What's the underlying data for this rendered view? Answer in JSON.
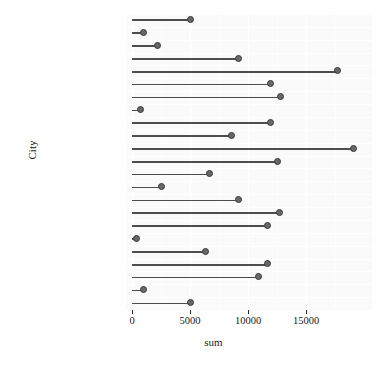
{
  "chart_data": {
    "type": "bar",
    "subtype": "lollipop-horizontal",
    "title": "",
    "xlabel": "sum",
    "ylabel": "City",
    "xlim": [
      0,
      19500
    ],
    "ylim": null,
    "grid": true,
    "legend": "none",
    "orientation": "horizontal",
    "x_ticks": [
      0,
      5000,
      10000,
      15000
    ],
    "x_tick_labels": [
      "0",
      "5000",
      "10000",
      "15000"
    ],
    "categories": [
      "Yakima",
      "Walla Walla",
      "Victoria",
      "Vancouver",
      "Tacoma",
      "Spokane",
      "Seattle",
      "San Francisco",
      "San Diego",
      "San Andres",
      "Salem",
      "Portland",
      "Orizaba",
      "Mexico City",
      "Merida",
      "Los Angeles",
      "Hidalgo",
      "Guadalajara",
      "Camacho",
      "Bremerton",
      "Beverly Hills",
      "Bellingham",
      "Acapulco"
    ],
    "values": [
      5000,
      1000,
      2200,
      9200,
      17700,
      11900,
      12800,
      700,
      11900,
      8600,
      19100,
      12500,
      6700,
      2500,
      9200,
      12700,
      11700,
      400,
      6300,
      11700,
      10900,
      1000,
      5000
    ],
    "colors": {
      "dot_fill": "#686868",
      "dot_stroke": "#3a3a3a",
      "stem": "#4d4d4d",
      "panel_background": "#fafafa",
      "gridline": "#ffffff",
      "text": "#1a1a1a",
      "page_background": "#ffffff"
    }
  }
}
